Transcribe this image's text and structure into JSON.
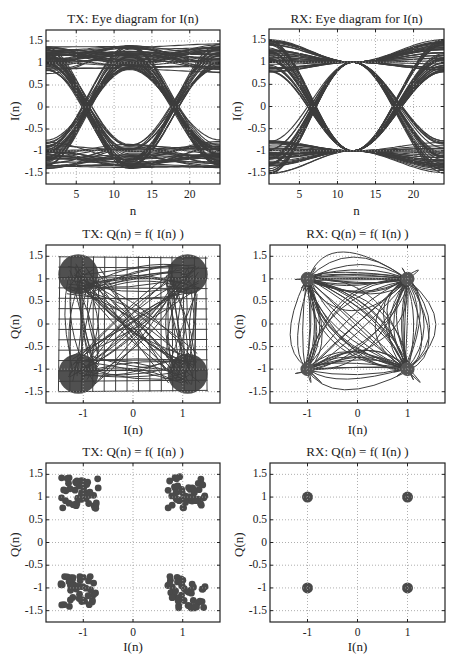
{
  "figure": {
    "top_cut_text": "",
    "trace_color": "#3d3d3d",
    "grid_color": "#9a9a9a"
  },
  "panels": [
    {
      "id": "tx-eye",
      "title": "TX: Eye diagram for I(n)",
      "xlabel": "n",
      "ylabel": "I(n)",
      "xticks": [
        "5",
        "10",
        "15",
        "20"
      ],
      "yticks": [
        "1.5",
        "1",
        "0.5",
        "0",
        "-0.5",
        "-1",
        "-1.5"
      ]
    },
    {
      "id": "rx-eye",
      "title": "RX: Eye diagram for I(n)",
      "xlabel": "n",
      "ylabel": "I(n)",
      "xticks": [
        "5",
        "10",
        "15",
        "20"
      ],
      "yticks": [
        "1.5",
        "1",
        "0.5",
        "0",
        "-0.5",
        "-1",
        "-1.5"
      ]
    },
    {
      "id": "tx-iq-trace",
      "title": "TX: Q(n) = f( I(n) )",
      "xlabel": "I(n)",
      "ylabel": "Q(n)",
      "xticks": [
        "-1",
        "0",
        "1"
      ],
      "yticks": [
        "1.5",
        "1",
        "0.5",
        "0",
        "-0.5",
        "-1",
        "-1.5"
      ]
    },
    {
      "id": "rx-iq-trace",
      "title": "RX: Q(n) = f( I(n) )",
      "xlabel": "I(n)",
      "ylabel": "Q(n)",
      "xticks": [
        "-1",
        "0",
        "1"
      ],
      "yticks": [
        "1.5",
        "1",
        "0.5",
        "0",
        "-0.5",
        "-1",
        "-1.5"
      ]
    },
    {
      "id": "tx-constellation",
      "title": "TX: Q(n) = f( I(n) )",
      "xlabel": "I(n)",
      "ylabel": "Q(n)",
      "xticks": [
        "-1",
        "0",
        "1"
      ],
      "yticks": [
        "1.5",
        "1",
        "0.5",
        "0",
        "-0.5",
        "-1",
        "-1.5"
      ]
    },
    {
      "id": "rx-constellation",
      "title": "RX: Q(n) = f( I(n) )",
      "xlabel": "I(n)",
      "ylabel": "Q(n)",
      "xticks": [
        "-1",
        "0",
        "1"
      ],
      "yticks": [
        "1.5",
        "1",
        "0.5",
        "0",
        "-0.5",
        "-1",
        "-1.5"
      ]
    }
  ],
  "chart_data": [
    {
      "type": "line",
      "title": "TX: Eye diagram for I(n)",
      "xlabel": "n",
      "ylabel": "I(n)",
      "xlim": [
        1,
        24
      ],
      "ylim": [
        -1.75,
        1.75
      ],
      "grid": true,
      "xticks": [
        5,
        10,
        15,
        20
      ],
      "yticks": [
        -1.5,
        -1,
        -0.5,
        0,
        0.5,
        1,
        1.5
      ],
      "description": "Overlaid symbol traces; open eye centered at n≈12, rails near ±0.8..±1.5, crossings at n≈1 and n≈23 around 0"
    },
    {
      "type": "line",
      "title": "RX: Eye diagram for I(n)",
      "xlabel": "n",
      "ylabel": "I(n)",
      "xlim": [
        1,
        24
      ],
      "ylim": [
        -1.75,
        1.75
      ],
      "grid": true,
      "xticks": [
        5,
        10,
        15,
        20
      ],
      "yticks": [
        -1.5,
        -1,
        -0.5,
        0,
        0.5,
        1,
        1.5
      ],
      "description": "Traces converge to ±1 at n≈12 (sampling instant), spread to ±1.7 at edges"
    },
    {
      "type": "line",
      "title": "TX: Q(n) = f( I(n) )",
      "xlabel": "I(n)",
      "ylabel": "Q(n)",
      "xlim": [
        -1.75,
        1.75
      ],
      "ylim": [
        -1.75,
        1.75
      ],
      "grid": true,
      "xticks": [
        -1,
        0,
        1
      ],
      "yticks": [
        -1.5,
        -1,
        -0.5,
        0,
        0.5,
        1,
        1.5
      ],
      "description": "IQ trajectory filling square ±1.5 with X pattern; clusters at (±1,±1)"
    },
    {
      "type": "line",
      "title": "RX: Q(n) = f( I(n) )",
      "xlabel": "I(n)",
      "ylabel": "Q(n)",
      "xlim": [
        -1.75,
        1.75
      ],
      "ylim": [
        -1.75,
        1.75
      ],
      "grid": true,
      "xticks": [
        -1,
        0,
        1
      ],
      "yticks": [
        -1.5,
        -1,
        -0.5,
        0,
        0.5,
        1,
        1.5
      ],
      "description": "Looping IQ trajectory with convergence points at (±1,±1)"
    },
    {
      "type": "scatter",
      "title": "TX: Q(n) = f( I(n) )",
      "xlabel": "I(n)",
      "ylabel": "Q(n)",
      "xlim": [
        -1.75,
        1.75
      ],
      "ylim": [
        -1.75,
        1.75
      ],
      "grid": true,
      "xticks": [
        -1,
        0,
        1
      ],
      "yticks": [
        -1.5,
        -1,
        -0.5,
        0,
        0.5,
        1,
        1.5
      ],
      "clusters": [
        {
          "center": [
            -1.1,
            1.1
          ],
          "spread": [
            [
              -1.45,
              -0.7
            ],
            [
              0.75,
              1.45
            ]
          ]
        },
        {
          "center": [
            1.1,
            1.1
          ],
          "spread": [
            [
              0.7,
              1.45
            ],
            [
              0.75,
              1.45
            ]
          ]
        },
        {
          "center": [
            -1.1,
            -1.1
          ],
          "spread": [
            [
              -1.45,
              -0.75
            ],
            [
              -1.45,
              -0.75
            ]
          ]
        },
        {
          "center": [
            1.1,
            -1.1
          ],
          "spread": [
            [
              0.7,
              1.45
            ],
            [
              -1.45,
              -0.75
            ]
          ]
        }
      ]
    },
    {
      "type": "scatter",
      "title": "RX: Q(n) = f( I(n) )",
      "xlabel": "I(n)",
      "ylabel": "Q(n)",
      "xlim": [
        -1.75,
        1.75
      ],
      "ylim": [
        -1.75,
        1.75
      ],
      "grid": true,
      "xticks": [
        -1,
        0,
        1
      ],
      "yticks": [
        -1.5,
        -1,
        -0.5,
        0,
        0.5,
        1,
        1.5
      ],
      "x": [
        -1,
        1,
        -1,
        1
      ],
      "y": [
        1,
        1,
        -1,
        -1
      ]
    }
  ]
}
